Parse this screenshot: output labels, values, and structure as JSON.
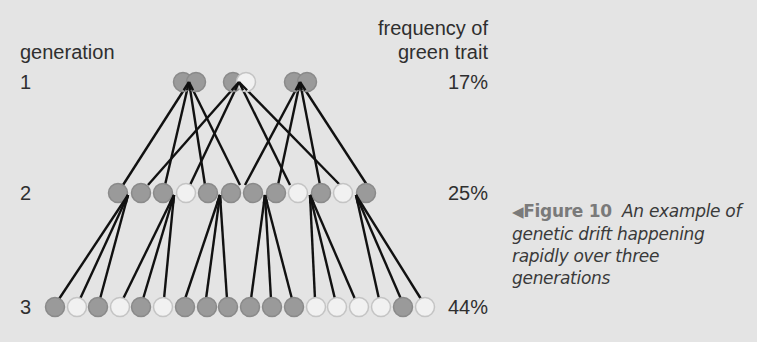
{
  "labels": {
    "generation_header": "generation",
    "frequency_header_line1": "frequency of",
    "frequency_header_line2": "green trait"
  },
  "generations": [
    {
      "number": "1",
      "frequency": "17%",
      "y": 82,
      "circles": [
        {
          "x": 183,
          "c": "G"
        },
        {
          "x": 196,
          "c": "G"
        },
        {
          "x": 233,
          "c": "G"
        },
        {
          "x": 246,
          "c": "W"
        },
        {
          "x": 294,
          "c": "G"
        },
        {
          "x": 307,
          "c": "G"
        }
      ]
    },
    {
      "number": "2",
      "frequency": "25%",
      "y": 193,
      "circles": [
        {
          "x": 118,
          "c": "G"
        },
        {
          "x": 141,
          "c": "G"
        },
        {
          "x": 163,
          "c": "G"
        },
        {
          "x": 186,
          "c": "W"
        },
        {
          "x": 208,
          "c": "G"
        },
        {
          "x": 231,
          "c": "G"
        },
        {
          "x": 253,
          "c": "G"
        },
        {
          "x": 276,
          "c": "G"
        },
        {
          "x": 298,
          "c": "W"
        },
        {
          "x": 321,
          "c": "G"
        },
        {
          "x": 343,
          "c": "W"
        },
        {
          "x": 366,
          "c": "G"
        }
      ]
    },
    {
      "number": "3",
      "frequency": "44%",
      "y": 307,
      "circles": [
        {
          "x": 55,
          "c": "G"
        },
        {
          "x": 77,
          "c": "W"
        },
        {
          "x": 98,
          "c": "G"
        },
        {
          "x": 120,
          "c": "W"
        },
        {
          "x": 141,
          "c": "G"
        },
        {
          "x": 163,
          "c": "W"
        },
        {
          "x": 185,
          "c": "G"
        },
        {
          "x": 207,
          "c": "G"
        },
        {
          "x": 228,
          "c": "G"
        },
        {
          "x": 250,
          "c": "G"
        },
        {
          "x": 272,
          "c": "G"
        },
        {
          "x": 294,
          "c": "G"
        },
        {
          "x": 316,
          "c": "W"
        },
        {
          "x": 337,
          "c": "W"
        },
        {
          "x": 359,
          "c": "W"
        },
        {
          "x": 381,
          "c": "W"
        },
        {
          "x": 403,
          "c": "G"
        },
        {
          "x": 425,
          "c": "W"
        }
      ]
    }
  ],
  "links_1_to_2": [
    {
      "from": [
        189,
        82
      ],
      "to": [
        123,
        185
      ]
    },
    {
      "from": [
        189,
        82
      ],
      "to": [
        165,
        185
      ]
    },
    {
      "from": [
        189,
        82
      ],
      "to": [
        205,
        185
      ]
    },
    {
      "from": [
        189,
        82
      ],
      "to": [
        240,
        185
      ]
    },
    {
      "from": [
        239,
        82
      ],
      "to": [
        148,
        185
      ]
    },
    {
      "from": [
        239,
        82
      ],
      "to": [
        190,
        185
      ]
    },
    {
      "from": [
        239,
        82
      ],
      "to": [
        290,
        185
      ]
    },
    {
      "from": [
        239,
        82
      ],
      "to": [
        340,
        185
      ]
    },
    {
      "from": [
        300,
        82
      ],
      "to": [
        245,
        185
      ]
    },
    {
      "from": [
        300,
        82
      ],
      "to": [
        278,
        185
      ]
    },
    {
      "from": [
        300,
        82
      ],
      "to": [
        320,
        185
      ]
    },
    {
      "from": [
        300,
        82
      ],
      "to": [
        367,
        185
      ]
    }
  ],
  "links_2_to_3": [
    {
      "from": [
        128,
        195
      ],
      "to": [
        59,
        299
      ]
    },
    {
      "from": [
        128,
        195
      ],
      "to": [
        80,
        299
      ]
    },
    {
      "from": [
        128,
        195
      ],
      "to": [
        100,
        299
      ]
    },
    {
      "from": [
        174,
        195
      ],
      "to": [
        123,
        299
      ]
    },
    {
      "from": [
        174,
        195
      ],
      "to": [
        143,
        299
      ]
    },
    {
      "from": [
        174,
        195
      ],
      "to": [
        164,
        299
      ]
    },
    {
      "from": [
        220,
        195
      ],
      "to": [
        185,
        299
      ]
    },
    {
      "from": [
        220,
        195
      ],
      "to": [
        206,
        299
      ]
    },
    {
      "from": [
        220,
        195
      ],
      "to": [
        227,
        299
      ]
    },
    {
      "from": [
        265,
        195
      ],
      "to": [
        251,
        299
      ]
    },
    {
      "from": [
        265,
        195
      ],
      "to": [
        271,
        299
      ]
    },
    {
      "from": [
        265,
        195
      ],
      "to": [
        292,
        299
      ]
    },
    {
      "from": [
        310,
        195
      ],
      "to": [
        315,
        299
      ]
    },
    {
      "from": [
        310,
        195
      ],
      "to": [
        335,
        299
      ]
    },
    {
      "from": [
        310,
        195
      ],
      "to": [
        355,
        299
      ]
    },
    {
      "from": [
        356,
        195
      ],
      "to": [
        379,
        299
      ]
    },
    {
      "from": [
        356,
        195
      ],
      "to": [
        401,
        299
      ]
    },
    {
      "from": [
        356,
        195
      ],
      "to": [
        421,
        299
      ]
    }
  ],
  "colors": {
    "background": "#e4e4e4",
    "trait_G_fill": "#9a9a9a",
    "trait_G_stroke": "#8a8a8a",
    "trait_W_fill": "#f1f1f1",
    "trait_W_stroke": "#c4c4c4",
    "line": "#111111"
  },
  "caption": {
    "arrow_icon": "◀",
    "figure_label": "Figure 10",
    "text": "An example of genetic drift happening rapidly over three generations"
  }
}
